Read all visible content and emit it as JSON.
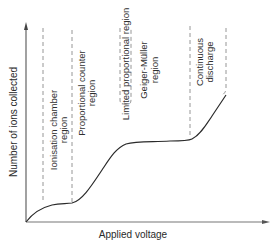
{
  "diagram": {
    "axes": {
      "x_label": "Applied voltage",
      "y_label": "Number of ions collected"
    },
    "regions": [
      {
        "id": "ionisation",
        "lines": [
          "Ionisation chamber",
          "region"
        ]
      },
      {
        "id": "proportional",
        "lines": [
          "Proportional counter",
          "region"
        ]
      },
      {
        "id": "limited-proportional",
        "lines": [
          "Limited proportional region"
        ]
      },
      {
        "id": "geiger-muller",
        "lines": [
          "Geiger-Müller",
          "region"
        ]
      },
      {
        "id": "continuous-discharge",
        "lines": [
          "Continuous",
          "discharge"
        ]
      }
    ],
    "colors": {
      "curve": "#2a2a2a",
      "axis": "#555555",
      "dashed": "#8a8a8a",
      "text": "#2f2f2f"
    }
  }
}
